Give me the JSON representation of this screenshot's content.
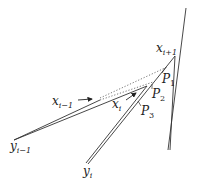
{
  "diagram": {
    "labels": {
      "x_i_plus_1": {
        "base": "x",
        "sub": "i+1"
      },
      "x_i_minus_1": {
        "base": "x",
        "sub": "i−1"
      },
      "x_i": {
        "base": "x",
        "sub": "i"
      },
      "y_i_minus_1": {
        "base": "y",
        "sub": "i−1"
      },
      "y_i": {
        "base": "y",
        "sub": "i"
      },
      "P1": {
        "base": "P",
        "sub": "1"
      },
      "P2": {
        "base": "P",
        "sub": "2"
      },
      "P3": {
        "base": "P",
        "sub": "3"
      }
    },
    "colors": {
      "line": "#333333",
      "dotted": "#666666",
      "background": "#ffffff"
    }
  }
}
